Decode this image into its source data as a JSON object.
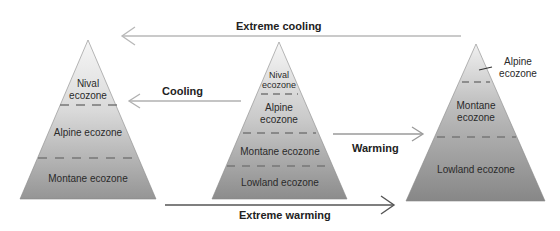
{
  "diagram": {
    "type": "ecozone-shift-pyramids",
    "arrows": {
      "extreme_cooling": "Extreme cooling",
      "cooling": "Cooling",
      "warming": "Warming",
      "extreme_warming": "Extreme warming"
    },
    "left_pyramid": {
      "zones": [
        "Nival",
        "ecozone",
        "Alpine ecozone",
        "Montane ecozone"
      ]
    },
    "center_pyramid": {
      "zones": [
        "Nival",
        "ecozone",
        "Alpine",
        "ecozone",
        "Montane ecozone",
        "Lowland ecozone"
      ]
    },
    "right_pyramid": {
      "zones": [
        "Alpine",
        "ecozone",
        "Montane",
        "ecozone",
        "Lowland ecozone"
      ]
    },
    "colors": {
      "pyramid_top": "#f4f4f4",
      "pyramid_bottom": "#8c8c8c",
      "arrow_light": "#b5b5b5",
      "arrow_dark": "#555555"
    }
  }
}
